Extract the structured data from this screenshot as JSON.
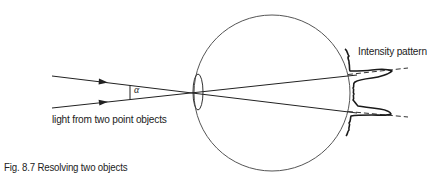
{
  "figure": {
    "caption": "Fig. 8.7  Resolving two objects",
    "labels": {
      "light_source": "light from two point objects",
      "intensity": "Intensity pattern",
      "angle": "α"
    },
    "colors": {
      "stroke": "#222222",
      "eyeball": "#555555",
      "background": "#ffffff"
    },
    "elements": {
      "eyeball": {
        "shape": "circle",
        "cx": 272,
        "cy": 93,
        "r": 78
      },
      "lens": {
        "shape": "ellipse",
        "cx": 198,
        "cy": 92,
        "rx": 5,
        "ry": 17
      },
      "rays": [
        {
          "name": "upper-ray",
          "from": [
            52,
            76
          ],
          "to": [
            357,
            113
          ],
          "arrow_at": [
            104,
            82
          ]
        },
        {
          "name": "lower-ray",
          "from": [
            52,
            108
          ],
          "to": [
            357,
            75
          ],
          "arrow_at": [
            104,
            102
          ]
        }
      ],
      "intensity_peaks": 2
    }
  }
}
